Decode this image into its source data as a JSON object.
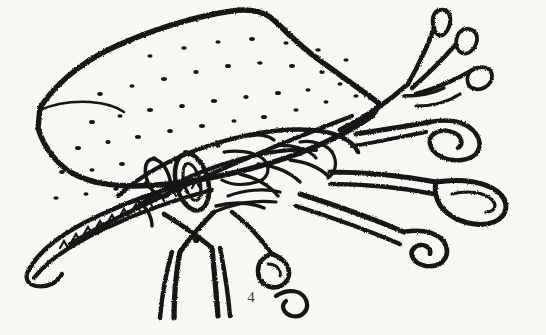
{
  "figure": {
    "label": "4",
    "caption_number": "4",
    "technique": "stippled-ink-line-drawing",
    "background_color": "#f8f7f4",
    "ink_color": "#161412",
    "label_color": "#3c3a38",
    "width": 546,
    "height": 335
  },
  "anatomy": {
    "pronotal_shield": {
      "name": "pronotum-shield",
      "texture": "punctate-stipple",
      "apex_x": 235,
      "apex_y": 12
    },
    "antennae": {
      "name": "antennae",
      "count": 3,
      "tip_shape": "clubbed",
      "position": "upper-right"
    },
    "appendages_right": {
      "name": "right-appendages",
      "count": 3,
      "tip_shape": "paddle-spiral",
      "position": "right"
    },
    "legs_lower": {
      "name": "lower-legs",
      "count": 2,
      "shape": "v-splay",
      "position": "bottom-center"
    },
    "ventral_margin": {
      "name": "ventral-serrated-margin",
      "texture": "serrate-toothed",
      "position": "lower-left"
    },
    "eye_structure": {
      "name": "compound-eye-oval",
      "position": "center-left"
    }
  }
}
